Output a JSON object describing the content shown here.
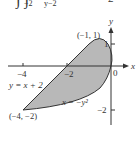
{
  "equation_fragment": {
    "integral_symbols": "∫ ∫",
    "outer_lower_limit": "−2",
    "inner_lower_limit": "y−2",
    "rhs_fragment": "2"
  },
  "diagram": {
    "axes": {
      "x_label": "x",
      "y_label": "y",
      "x_ticks": [
        {
          "value": -4,
          "label": "−4"
        },
        {
          "value": -2,
          "label": "−2"
        }
      ],
      "y_ticks": [
        {
          "value": 1,
          "label": "1"
        },
        {
          "value": -2,
          "label": "−2"
        }
      ],
      "origin_label": "0"
    },
    "curves": [
      {
        "name": "line",
        "label": "y = x + 2"
      },
      {
        "name": "parabola",
        "label": "x = −y²"
      }
    ],
    "points": [
      {
        "coords": [
          -1,
          1
        ],
        "label": "(−1, 1)"
      },
      {
        "coords": [
          -4,
          -2
        ],
        "label": "(−4, −2)"
      }
    ],
    "shaded_region": "between y = x + 2 and x = −y²",
    "colors": {
      "fill": "#b8b8b8",
      "stroke": "#333333"
    }
  }
}
